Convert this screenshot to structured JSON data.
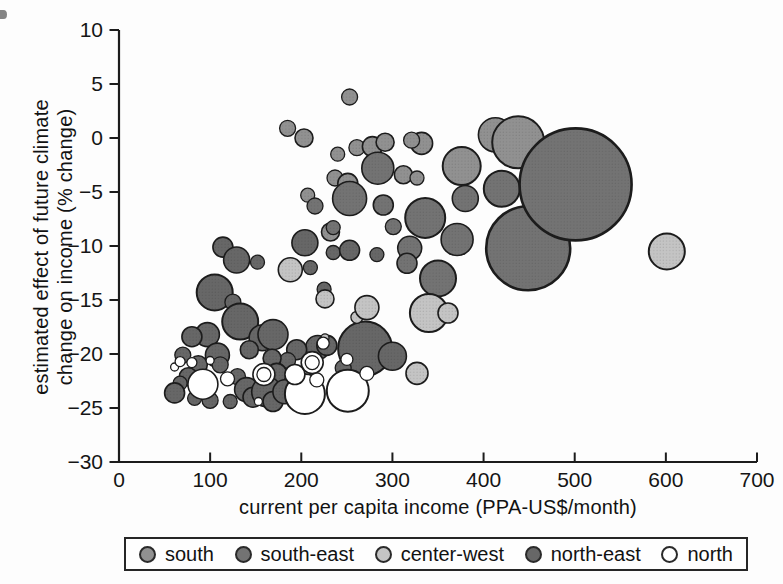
{
  "chart_data": {
    "type": "scatter",
    "subtype": "bubble",
    "title": "",
    "xlabel": "current per capita income (PPA-US$/month)",
    "ylabel_line1": "estimated effect of future climate",
    "ylabel_line2": "change on income (% change)",
    "xlim": [
      0,
      700
    ],
    "ylim": [
      -30,
      10
    ],
    "xticks": [
      0,
      100,
      200,
      300,
      400,
      500,
      600,
      700
    ],
    "yticks": [
      10,
      5,
      0,
      -5,
      -10,
      -15,
      -20,
      -25,
      -30
    ],
    "grid": false,
    "legend_position": "bottom",
    "legend": [
      {
        "key": "south",
        "label": "south",
        "color": "#919191"
      },
      {
        "key": "south-east",
        "label": "south-east",
        "color": "#737373"
      },
      {
        "key": "center-west",
        "label": "center-west",
        "color": "#c4c4c4"
      },
      {
        "key": "north-east",
        "label": "north-east",
        "color": "#676767"
      },
      {
        "key": "north",
        "label": "north",
        "color": "#ffffff"
      }
    ],
    "point_format": [
      "region",
      "x_income",
      "y_pct_change",
      "radius_px"
    ],
    "points": [
      [
        "south",
        253,
        3.8,
        8
      ],
      [
        "south",
        185,
        0.9,
        8
      ],
      [
        "south",
        203,
        0,
        9
      ],
      [
        "south",
        240,
        -1.5,
        7
      ],
      [
        "south",
        261,
        -0.9,
        8
      ],
      [
        "south",
        278,
        -0.8,
        10
      ],
      [
        "south",
        292,
        -0.4,
        9
      ],
      [
        "south",
        332,
        -0.5,
        11
      ],
      [
        "south",
        321,
        -0.2,
        8
      ],
      [
        "south",
        237,
        -3.7,
        8
      ],
      [
        "south",
        251,
        -4.2,
        10
      ],
      [
        "south",
        207,
        -5.3,
        7
      ],
      [
        "south",
        232,
        -8.7,
        9
      ],
      [
        "south",
        312,
        -3.4,
        9
      ],
      [
        "south",
        327,
        -3.7,
        7
      ],
      [
        "south",
        413,
        0.3,
        17
      ],
      [
        "south",
        438,
        -0.4,
        26
      ],
      [
        "south",
        376,
        -2.6,
        19
      ],
      [
        "south-east",
        284,
        -2.8,
        16
      ],
      [
        "south-east",
        420,
        -4.7,
        18
      ],
      [
        "south-east",
        380,
        -5.6,
        13
      ],
      [
        "south-east",
        449,
        -10.2,
        42
      ],
      [
        "south-east",
        501,
        -4.3,
        56
      ],
      [
        "south-east",
        253,
        -5.6,
        17
      ],
      [
        "south-east",
        215,
        -6.3,
        8
      ],
      [
        "south-east",
        290,
        -6.2,
        10
      ],
      [
        "south-east",
        301,
        -8.2,
        8
      ],
      [
        "south-east",
        336,
        -7.4,
        20
      ],
      [
        "south-east",
        371,
        -9.4,
        16
      ],
      [
        "south-east",
        235,
        -8.3,
        7
      ],
      [
        "south-east",
        319,
        -10.2,
        12
      ],
      [
        "south-east",
        316,
        -11.6,
        10
      ],
      [
        "south-east",
        350,
        -13,
        18
      ],
      [
        "north-east",
        114,
        -10.1,
        10
      ],
      [
        "north-east",
        129,
        -11.3,
        13
      ],
      [
        "north-east",
        152,
        -11.5,
        7
      ],
      [
        "north-east",
        204,
        -9.7,
        13
      ],
      [
        "north-east",
        235,
        -10.6,
        7
      ],
      [
        "north-east",
        253,
        -10.4,
        10
      ],
      [
        "north-east",
        283,
        -10.8,
        7
      ],
      [
        "north-east",
        210,
        -12,
        7
      ],
      [
        "north-east",
        225,
        -14,
        7
      ],
      [
        "north-east",
        105,
        -14.3,
        18
      ],
      [
        "north-east",
        125,
        -15.2,
        8
      ],
      [
        "north-east",
        133,
        -17,
        18
      ],
      [
        "north-east",
        97,
        -18.2,
        12
      ],
      [
        "north-east",
        80,
        -18.4,
        10
      ],
      [
        "north-east",
        157,
        -18.5,
        13
      ],
      [
        "north-east",
        169,
        -18.2,
        15
      ],
      [
        "north-east",
        143,
        -19.6,
        9
      ],
      [
        "north-east",
        108,
        -20.1,
        12
      ],
      [
        "north-east",
        70,
        -20.1,
        8
      ],
      [
        "north-east",
        218,
        -19.4,
        12
      ],
      [
        "north-east",
        228,
        -19.2,
        10
      ],
      [
        "north-east",
        270,
        -19.5,
        27
      ],
      [
        "north-east",
        300,
        -20.2,
        14
      ],
      [
        "north-east",
        195,
        -19.6,
        10
      ],
      [
        "north-east",
        185,
        -20.6,
        8
      ],
      [
        "north-east",
        168,
        -20.4,
        9
      ],
      [
        "north-east",
        87,
        -21,
        9
      ],
      [
        "north-east",
        111,
        -21,
        8
      ],
      [
        "north-east",
        173,
        -21.8,
        10
      ],
      [
        "north-east",
        246,
        -21.3,
        8
      ],
      [
        "north-east",
        76,
        -22.1,
        9
      ],
      [
        "north-east",
        67,
        -22.7,
        7
      ],
      [
        "north-east",
        130,
        -22.1,
        8
      ],
      [
        "north-east",
        61,
        -23.6,
        10
      ],
      [
        "north-east",
        83,
        -24.1,
        7
      ],
      [
        "north-east",
        100,
        -24.3,
        8
      ],
      [
        "north-east",
        122,
        -24.4,
        7
      ],
      [
        "north-east",
        140,
        -23.3,
        12
      ],
      [
        "north-east",
        147,
        -24,
        10
      ],
      [
        "north-east",
        162,
        -23.5,
        15
      ],
      [
        "north-east",
        169,
        -24.4,
        10
      ],
      [
        "north-east",
        182,
        -23.5,
        12
      ],
      [
        "north-east",
        243,
        -24.3,
        8
      ],
      [
        "center-west",
        601,
        -10.5,
        18
      ],
      [
        "center-west",
        188,
        -12.2,
        12
      ],
      [
        "center-west",
        226,
        -14.9,
        9
      ],
      [
        "center-west",
        261,
        -16.6,
        6
      ],
      [
        "center-west",
        272,
        -15.7,
        12
      ],
      [
        "center-west",
        340,
        -16.2,
        19
      ],
      [
        "center-west",
        361,
        -16.2,
        10
      ],
      [
        "center-west",
        327,
        -21.8,
        11
      ],
      [
        "center-west",
        226,
        -18.5,
        4
      ],
      [
        "north",
        92,
        -22.8,
        15
      ],
      [
        "north",
        204,
        -23.7,
        20
      ],
      [
        "north",
        251,
        -23.4,
        21
      ],
      [
        "north",
        61,
        -21.2,
        4
      ],
      [
        "north",
        67,
        -20.7,
        5
      ],
      [
        "north",
        80,
        -20.8,
        5
      ],
      [
        "north",
        100,
        -20.6,
        4
      ],
      [
        "north",
        119,
        -22.3,
        7
      ],
      [
        "north",
        193,
        -21.9,
        10
      ],
      [
        "north",
        224,
        -19,
        6
      ],
      [
        "north",
        217,
        -22.4,
        7
      ],
      [
        "north",
        250,
        -20.5,
        6
      ],
      [
        "north",
        272,
        -21.8,
        7
      ],
      [
        "north",
        159,
        -21.9,
        11
      ],
      [
        "north",
        159,
        -21.9,
        7
      ],
      [
        "north",
        212,
        -20.8,
        11
      ],
      [
        "north",
        212,
        -20.8,
        7
      ],
      [
        "north",
        153,
        -24.4,
        4
      ]
    ]
  }
}
